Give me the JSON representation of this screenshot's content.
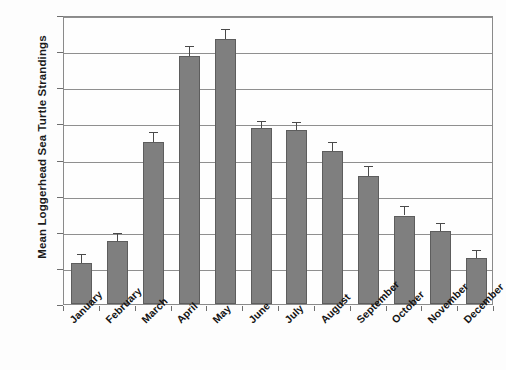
{
  "chart_data": {
    "type": "bar",
    "title": "",
    "xlabel": "",
    "ylabel": "Mean Loggerhead Sea Turtle Strandings",
    "ylim": [
      0,
      32
    ],
    "ytick_step": 4,
    "yticks": [
      0,
      4,
      8,
      12,
      16,
      20,
      24,
      28,
      32
    ],
    "grid": true,
    "legend": "none",
    "bar_color": "#7f7f7f",
    "bar_edge_color": "#5d5d5d",
    "error_bar_color": "#4a4a4a",
    "categories": [
      "January",
      "February",
      "March",
      "April",
      "May",
      "June",
      "July",
      "August",
      "September",
      "October",
      "November",
      "December"
    ],
    "values": [
      4.5,
      7.0,
      17.9,
      27.5,
      29.3,
      19.5,
      19.3,
      16.9,
      14.2,
      9.8,
      8.1,
      5.1
    ],
    "errors": [
      1.0,
      0.9,
      1.2,
      1.1,
      1.2,
      0.8,
      0.8,
      1.0,
      1.1,
      1.0,
      0.9,
      0.9
    ]
  },
  "axis": {
    "y_title": "Mean Loggerhead Sea Turtle Strandings"
  }
}
